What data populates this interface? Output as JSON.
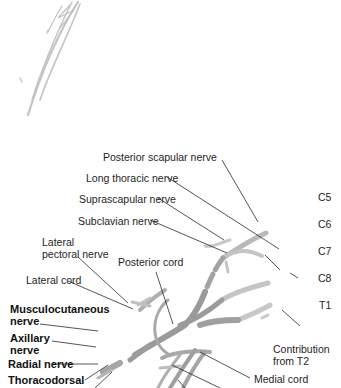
{
  "diagram": {
    "colors": {
      "nerve": "#a9a9a9",
      "nerve_light": "#c8c8c8",
      "nerve_dark": "#8f8f8f",
      "leader_line": "#2a2a2a",
      "background": "#ffffff"
    },
    "roots": [
      {
        "id": "c5",
        "label": "C5"
      },
      {
        "id": "c6",
        "label": "C6"
      },
      {
        "id": "c7",
        "label": "C7"
      },
      {
        "id": "c8",
        "label": "C8"
      },
      {
        "id": "t1",
        "label": "T1"
      }
    ],
    "contribution": {
      "line1": "Contribution",
      "line2": "from T2"
    },
    "labels_top": [
      {
        "id": "posterior-scapular",
        "text": "Posterior scapular nerve"
      },
      {
        "id": "long-thoracic",
        "text": "Long thoracic nerve"
      },
      {
        "id": "suprascapular",
        "text": "Suprascapular nerve"
      },
      {
        "id": "subclavian",
        "text": "Subclavian nerve"
      }
    ],
    "labels_left": [
      {
        "id": "lateral-pectoral",
        "line1": "Lateral",
        "line2": "pectoral nerve"
      },
      {
        "id": "lateral-cord",
        "text": "Lateral cord"
      },
      {
        "id": "posterior-cord",
        "text": "Posterior cord"
      }
    ],
    "labels_bold": [
      {
        "id": "musculocutaneous",
        "line1": "Musculocutaneous",
        "line2": "nerve"
      },
      {
        "id": "axillary",
        "line1": "Axillary",
        "line2": "nerve"
      },
      {
        "id": "radial",
        "text": "Radial nerve"
      },
      {
        "id": "thoracodorsal",
        "text": "Thoracodorsal"
      }
    ],
    "labels_right": [
      {
        "id": "medial-cord",
        "text": "Medial cord"
      }
    ]
  }
}
